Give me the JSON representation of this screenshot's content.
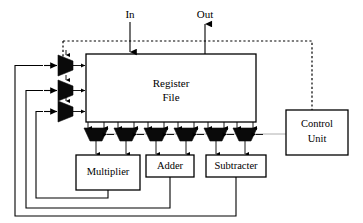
{
  "diagram": {
    "canvas": {
      "width": 363,
      "height": 223,
      "background": "#ffffff"
    },
    "colors": {
      "wire": "#000000",
      "mux_fill": "#0a0a0a",
      "box_fill": "#ffffff",
      "box_stroke": "#000000",
      "control_bus": "#9a9a9a",
      "dotted_bus": "#000000"
    },
    "io_ports": [
      {
        "name": "in-port",
        "label": "In",
        "direction": "input",
        "x": 130,
        "y": 14
      },
      {
        "name": "out-port",
        "label": "Out",
        "direction": "output",
        "x": 205,
        "y": 14
      }
    ],
    "blocks": [
      {
        "name": "register-file",
        "label_line1": "Register",
        "label_line2": "File",
        "x": 86,
        "y": 54,
        "w": 170,
        "h": 68
      },
      {
        "name": "control-unit",
        "label_line1": "Control",
        "label_line2": "Unit",
        "x": 286,
        "y": 110,
        "w": 62,
        "h": 45
      },
      {
        "name": "multiplier",
        "label_line1": "Multiplier",
        "label_line2": "",
        "x": 76,
        "y": 155,
        "w": 64,
        "h": 35
      },
      {
        "name": "adder",
        "label_line1": "Adder",
        "label_line2": "",
        "x": 146,
        "y": 155,
        "w": 48,
        "h": 22
      },
      {
        "name": "subtracter",
        "label_line1": "Subtracter",
        "label_line2": "",
        "x": 206,
        "y": 155,
        "w": 60,
        "h": 22
      }
    ],
    "input_muxes": [
      {
        "name": "input-mux-1",
        "cx": 66,
        "cy": 64
      },
      {
        "name": "input-mux-2",
        "cx": 66,
        "cy": 89
      },
      {
        "name": "input-mux-3",
        "cx": 66,
        "cy": 110
      }
    ],
    "output_muxes": [
      {
        "name": "output-mux-1",
        "cx": 96,
        "cy": 135
      },
      {
        "name": "output-mux-2",
        "cx": 126,
        "cy": 135
      },
      {
        "name": "output-mux-3",
        "cx": 156,
        "cy": 135
      },
      {
        "name": "output-mux-4",
        "cx": 186,
        "cy": 135
      },
      {
        "name": "output-mux-5",
        "cx": 216,
        "cy": 135
      },
      {
        "name": "output-mux-6",
        "cx": 245,
        "cy": 135
      }
    ],
    "buses": [
      {
        "name": "control-dotted-bus",
        "style": "dotted",
        "description": "Control Unit to input mux select lines"
      },
      {
        "name": "control-gray-bus",
        "style": "solid-gray",
        "description": "Control Unit to output mux select lines"
      }
    ],
    "feedback_paths": [
      {
        "name": "multiplier-feedback",
        "from": "multiplier",
        "to": "input-mux-3",
        "loop_x": 36,
        "loop_y": 198
      },
      {
        "name": "adder-feedback",
        "from": "adder",
        "to": "input-mux-2",
        "loop_x": 26,
        "loop_y": 208
      },
      {
        "name": "subtracter-feedback",
        "from": "subtracter",
        "to": "input-mux-1",
        "loop_x": 15,
        "loop_y": 216
      }
    ]
  }
}
